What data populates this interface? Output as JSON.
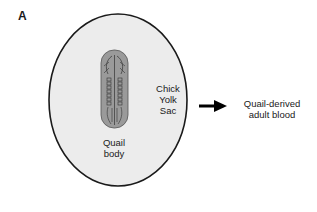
{
  "figure": {
    "panel_label": "A",
    "yolk_sac_label_lines": [
      "Chick",
      "Yolk",
      "Sac"
    ],
    "embryo_label_lines": [
      "Quail",
      "body"
    ],
    "output_label_lines": [
      "Quail-derived",
      "adult blood"
    ],
    "colors": {
      "yolk_sac_fill": "#ececec",
      "outline": "#1a1a1a",
      "embryo_fill": "#9a9a9a",
      "arrow": "#000000"
    }
  }
}
